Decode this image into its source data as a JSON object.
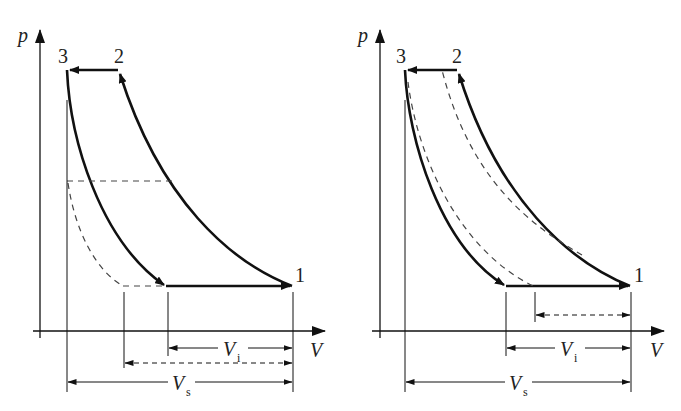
{
  "diagrams": [
    {
      "id": "left",
      "axis_labels": {
        "y": "p",
        "x": "V"
      },
      "points": [
        {
          "label": "1",
          "desc": "end of suction / start of compression"
        },
        {
          "label": "2",
          "desc": "end of compression / start of discharge"
        },
        {
          "label": "3",
          "desc": "end of discharge / start of re-expansion"
        }
      ],
      "dimensions": {
        "vi_label": "V",
        "vi_sub": "i",
        "vs_label": "V",
        "vs_sub": "s"
      },
      "variant": "reduced discharge pressure re-expansion (dashed) increases clearance effect"
    },
    {
      "id": "right",
      "axis_labels": {
        "y": "p",
        "x": "V"
      },
      "points": [
        {
          "label": "1"
        },
        {
          "label": "2"
        },
        {
          "label": "3"
        }
      ],
      "dimensions": {
        "vi_label": "V",
        "vi_sub": "i",
        "vs_label": "V",
        "vs_sub": "s"
      },
      "variant": "dashed compression/expansion curves shifted, smaller intake volume"
    }
  ],
  "colors": {
    "line": "#111111",
    "dashed": "#444444",
    "background": "#ffffff"
  }
}
